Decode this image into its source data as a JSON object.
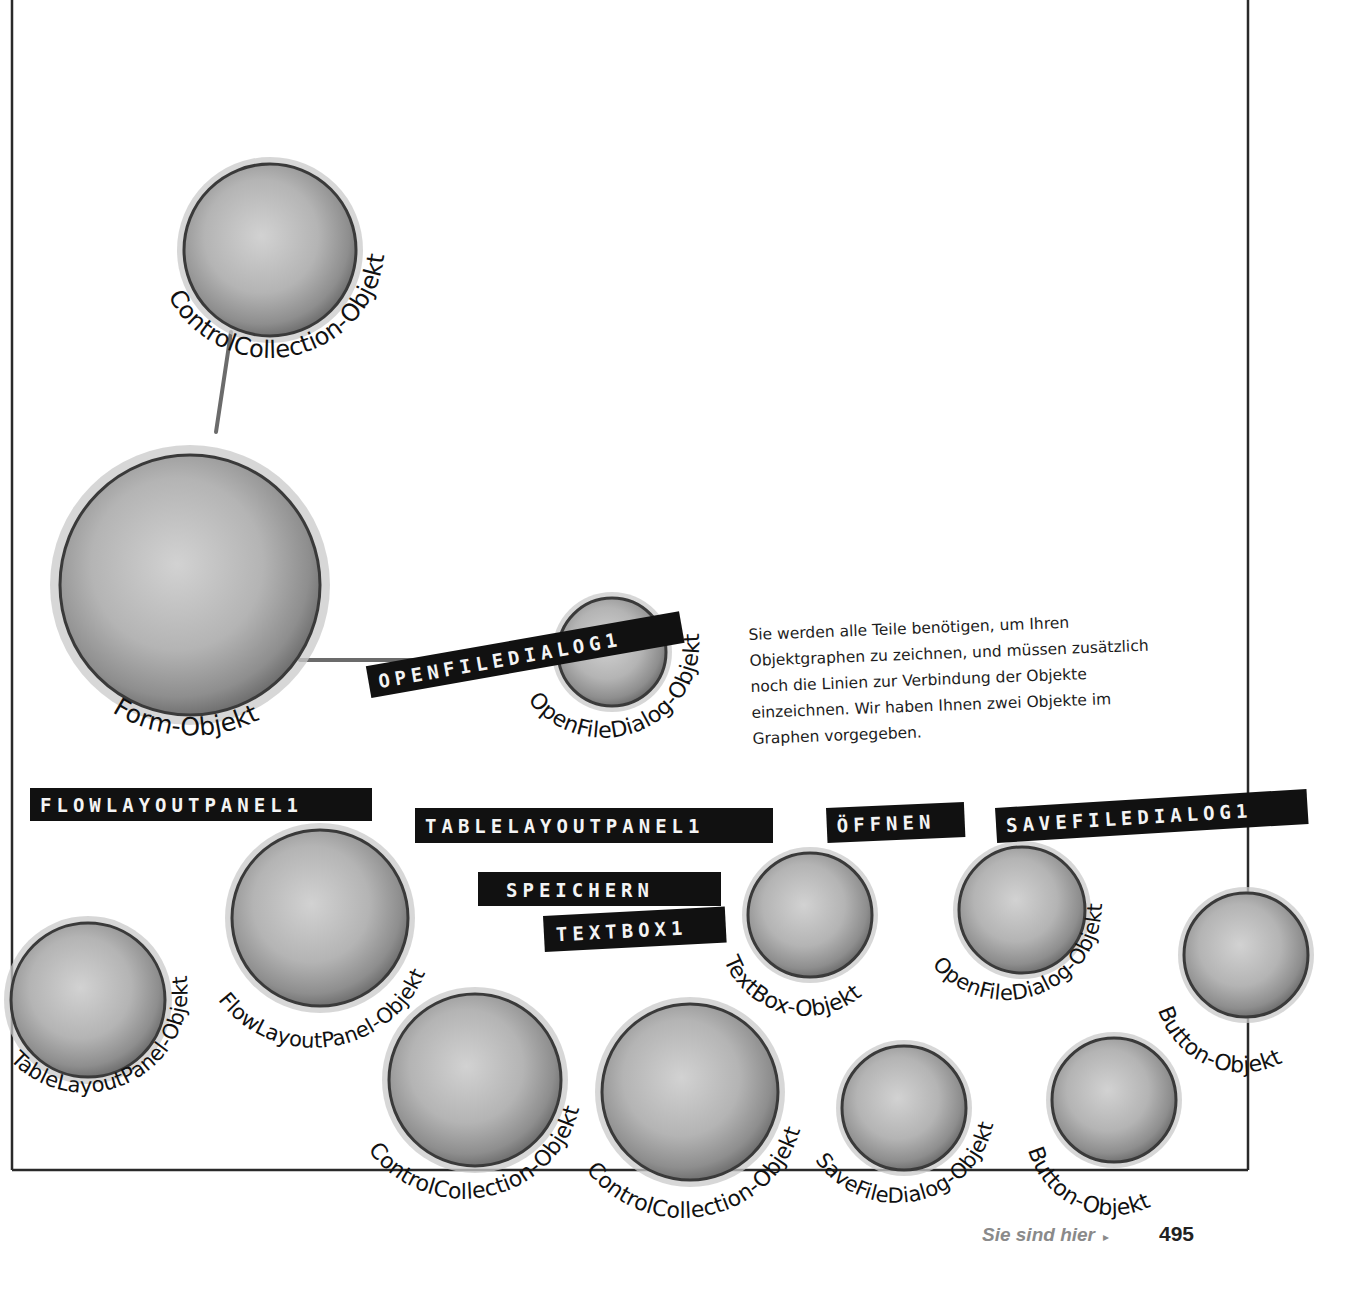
{
  "page": {
    "background": "#ffffff",
    "frame_color": "#2a2a2a",
    "ball_fill_light": "#cfcfcf",
    "ball_fill_dark": "#8a8a8a",
    "tag_color": "#111111"
  },
  "objects": [
    {
      "id": "controlcollection-top",
      "label": "ControlCollection-Objekt",
      "cx": 270,
      "cy": 250,
      "r": 88
    },
    {
      "id": "form",
      "label": "Form-Objekt",
      "cx": 190,
      "cy": 585,
      "r": 133
    },
    {
      "id": "openfiledialog-top",
      "label": "OpenFileDialog-Objekt",
      "cx": 612,
      "cy": 652,
      "r": 55
    },
    {
      "id": "tablelayoutpanel",
      "label": "TableLayoutPanel-Objekt",
      "cx": 88,
      "cy": 1000,
      "r": 78
    },
    {
      "id": "flowlayoutpanel",
      "label": "FlowLayoutPanel-Objekt",
      "cx": 320,
      "cy": 918,
      "r": 90
    },
    {
      "id": "textbox",
      "label": "TextBox-Objekt",
      "cx": 810,
      "cy": 915,
      "r": 63
    },
    {
      "id": "openfiledialog-2",
      "label": "OpenFileDialog-Objekt",
      "cx": 1022,
      "cy": 910,
      "r": 64
    },
    {
      "id": "button-right",
      "label": "Button-Objekt",
      "cx": 1246,
      "cy": 955,
      "r": 63
    },
    {
      "id": "controlcollection-1",
      "label": "ControlCollection-Objekt",
      "cx": 475,
      "cy": 1080,
      "r": 88
    },
    {
      "id": "controlcollection-2",
      "label": "ControlCollection-Objekt",
      "cx": 690,
      "cy": 1092,
      "r": 90
    },
    {
      "id": "savefiledialog",
      "label": "SaveFileDialog-Objekt",
      "cx": 904,
      "cy": 1108,
      "r": 63
    },
    {
      "id": "button-lower",
      "label": "Button-Objekt",
      "cx": 1114,
      "cy": 1100,
      "r": 63
    }
  ],
  "connections": [
    {
      "from": "form",
      "to": "controlcollection-top"
    },
    {
      "from": "form",
      "to": "openfiledialog-top"
    }
  ],
  "tags": [
    {
      "id": "openfiledialog1",
      "text": "OPENFILEDIALOG1"
    },
    {
      "id": "flowlayoutpanel1",
      "text": "FLOWLAYOUTPANEL1"
    },
    {
      "id": "tablelayoutpanel1",
      "text": "TABLELAYOUTPANEL1"
    },
    {
      "id": "oeffnen",
      "text": "ÖFFNEN"
    },
    {
      "id": "savefiledialog1",
      "text": "SAVEFILEDIALOG1"
    },
    {
      "id": "speichern",
      "text": "SPEICHERN"
    },
    {
      "id": "textbox1",
      "text": "TEXTBOX1"
    }
  ],
  "note": {
    "text": "Sie werden alle Teile benötigen, um Ihren Objektgraphen zu zeichnen, und müssen zusätzlich noch die Linien zur Verbindung der Objekte einzeichnen. Wir haben Ihnen zwei Objekte im Graphen vorgegeben."
  },
  "footer": {
    "you_are_here": "Sie sind hier",
    "arrow": "▸",
    "page_number": "495"
  }
}
